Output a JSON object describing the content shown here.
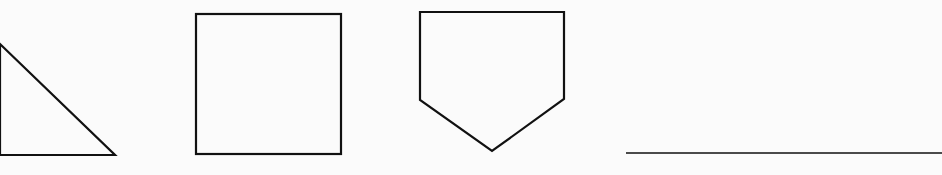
{
  "page": {
    "background": "#fbfbfb",
    "stroke_color": "#111111"
  },
  "figures": [
    {
      "name": "triangle",
      "kind": "right-triangle",
      "points": "0,44 115,155 0,155"
    },
    {
      "name": "square",
      "kind": "square",
      "x": 196,
      "y": 14,
      "width": 145,
      "height": 140
    },
    {
      "name": "pentagon",
      "kind": "pentagon",
      "points": "420,12 564,12 564,99 492,151 420,100"
    }
  ],
  "answer_line": {
    "x1": 626,
    "y1": 153,
    "x2": 942,
    "y2": 153
  }
}
